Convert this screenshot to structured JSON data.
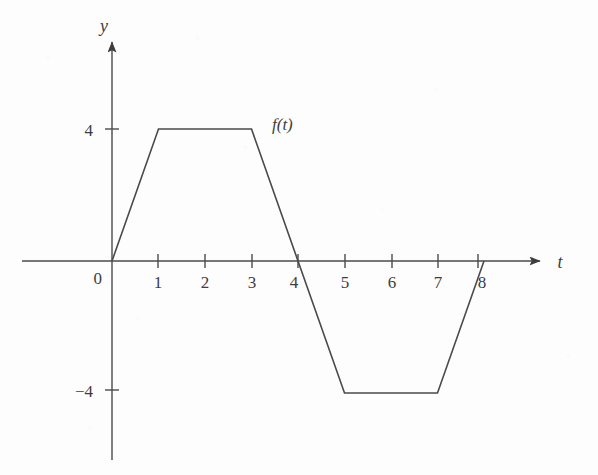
{
  "chart_data": {
    "type": "line",
    "title": "",
    "subtitle": "",
    "xlabel": "t",
    "ylabel": "y",
    "series": [
      {
        "name": "f(t)",
        "x": [
          0,
          1,
          3,
          5,
          7,
          8
        ],
        "values": [
          0,
          4,
          4,
          -4,
          -4,
          0
        ]
      }
    ],
    "annotations": [
      {
        "text": "f(t)",
        "x": 3.5,
        "y": 4.15
      }
    ],
    "xlim": [
      0,
      8.6
    ],
    "ylim": [
      -5.2,
      6.5
    ],
    "xticks": [
      1,
      2,
      3,
      4,
      5,
      6,
      7,
      8
    ],
    "xtick_labels": [
      "1",
      "2",
      "3",
      "4",
      "5",
      "6",
      "7",
      "8"
    ],
    "yticks": [
      4,
      -4
    ],
    "ytick_labels": [
      "4",
      "−4"
    ],
    "origin_label": "0",
    "grid": false,
    "legend": "none",
    "axis_arrows": true,
    "line_color": "#4a4a4a",
    "background_color": "#fdfdfd"
  },
  "labels": {
    "y_axis": "y",
    "t_axis": "t",
    "curve": "f(t)",
    "origin": "0",
    "y_tick_pos": "4",
    "y_tick_neg": "−4",
    "x_1": "1",
    "x_2": "2",
    "x_3": "3",
    "x_4": "4",
    "x_5": "5",
    "x_6": "6",
    "x_7": "7",
    "x_8": "8"
  }
}
